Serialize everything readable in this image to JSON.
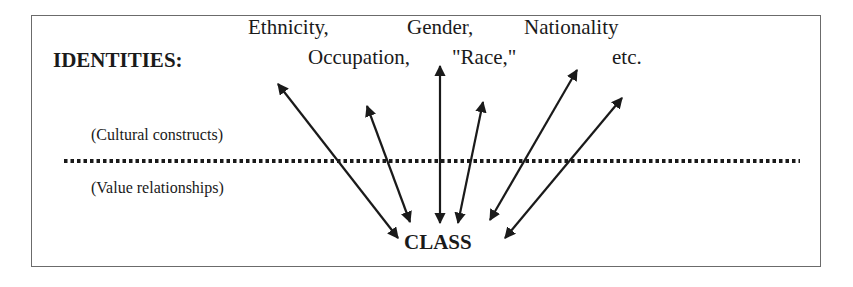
{
  "diagram": {
    "heading": "IDENTITIES:",
    "identities": [
      {
        "label": "Ethnicity,",
        "x": 248,
        "y": 17
      },
      {
        "label": "Gender,",
        "x": 407,
        "y": 17
      },
      {
        "label": "Nationality",
        "x": 524,
        "y": 17
      },
      {
        "label": "Occupation,",
        "x": 308,
        "y": 47
      },
      {
        "label": "\"Race,\"",
        "x": 452,
        "y": 47
      },
      {
        "label": "etc.",
        "x": 612,
        "y": 47
      }
    ],
    "upper_region_label": "(Cultural constructs)",
    "lower_region_label": "(Value relationships)",
    "center_node": "CLASS",
    "divider_style": "dotted",
    "arrows": [
      {
        "from": "CLASS",
        "to": "Ethnicity",
        "bidirectional": true
      },
      {
        "from": "CLASS",
        "to": "Occupation",
        "bidirectional": true
      },
      {
        "from": "CLASS",
        "to": "Gender",
        "bidirectional": true
      },
      {
        "from": "CLASS",
        "to": "Race",
        "bidirectional": true
      },
      {
        "from": "CLASS",
        "to": "Nationality",
        "bidirectional": true
      },
      {
        "from": "CLASS",
        "to": "etc.",
        "bidirectional": true
      }
    ]
  }
}
